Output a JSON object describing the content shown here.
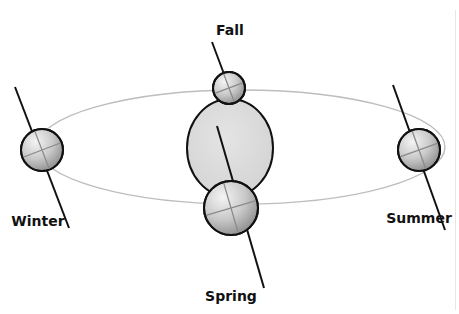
{
  "diagram": {
    "colors": {
      "orbit": "#bdbdbd",
      "outline": "#111111",
      "sun_fill": "#dcdcdc",
      "globe_light": "#f2f2f2",
      "globe_dark": "#9a9a9a",
      "axis": "#111111",
      "grid_lines": "#8a8a8a",
      "label": "#111111"
    },
    "orbit": {
      "cx": 241,
      "cy": 147,
      "rx": 204,
      "ry": 57
    },
    "sun": {
      "cx": 230,
      "cy": 148,
      "rx": 43,
      "ry": 49
    },
    "positions": [
      {
        "name": "Fall",
        "label": "Fall",
        "globe": {
          "cx": 229,
          "cy": 88,
          "r": 16
        },
        "axis": {
          "x1": 212,
          "y1": 42,
          "x2": 230,
          "y2": 90
        },
        "label_pos": {
          "x": 230,
          "y": 35
        }
      },
      {
        "name": "Winter",
        "label": "Winter",
        "globe": {
          "cx": 42,
          "cy": 150,
          "r": 21
        },
        "axis": {
          "x1": 15,
          "y1": 87,
          "x2": 69,
          "y2": 228
        },
        "label_pos": {
          "x": 38,
          "y": 226
        }
      },
      {
        "name": "Summer",
        "label": "Summer",
        "globe": {
          "cx": 419,
          "cy": 150,
          "r": 21
        },
        "axis": {
          "x1": 393,
          "y1": 85,
          "x2": 445,
          "y2": 230
        },
        "label_pos": {
          "x": 419,
          "y": 223
        }
      },
      {
        "name": "Spring",
        "label": "Spring",
        "globe": {
          "cx": 231,
          "cy": 208,
          "r": 27
        },
        "axis": {
          "x1": 217,
          "y1": 126,
          "x2": 264,
          "y2": 288
        },
        "label_pos": {
          "x": 231,
          "y": 301
        }
      }
    ]
  }
}
